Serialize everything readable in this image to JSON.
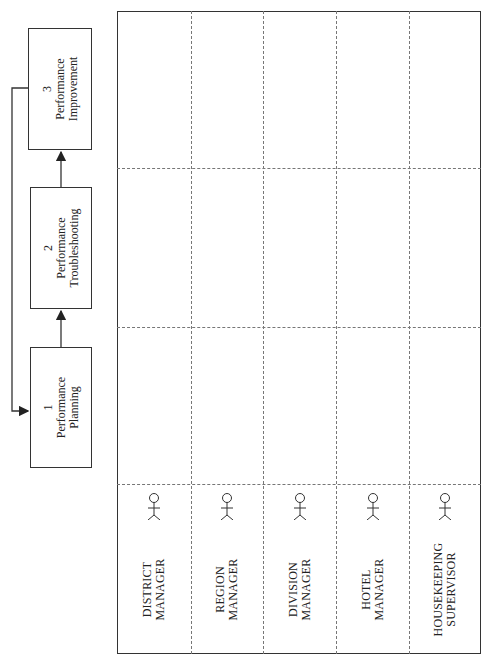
{
  "process": {
    "steps": [
      {
        "number": "1",
        "line1": "Performance",
        "line2": "Planning"
      },
      {
        "number": "2",
        "line1": "Performance",
        "line2": "Troubleshooting"
      },
      {
        "number": "3",
        "line1": "Performance",
        "line2": "Improvement"
      }
    ],
    "feedback_loop": "from step 3 back to step 1"
  },
  "swimlanes": {
    "roles": [
      {
        "line1": "DISTRICT",
        "line2": "MANAGER",
        "icon": "actor-icon"
      },
      {
        "line1": "REGION",
        "line2": "MANAGER",
        "icon": "actor-icon"
      },
      {
        "line1": "DIVISION",
        "line2": "MANAGER",
        "icon": "actor-icon"
      },
      {
        "line1": "HOTEL",
        "line2": "MANAGER",
        "icon": "actor-icon"
      },
      {
        "line1": "HOUSEKEEPING",
        "line2": "SUPERVISOR",
        "icon": "actor-icon"
      }
    ],
    "columns": 3
  },
  "colors": {
    "line": "#333333",
    "dashed": "#777777",
    "background": "#ffffff"
  }
}
